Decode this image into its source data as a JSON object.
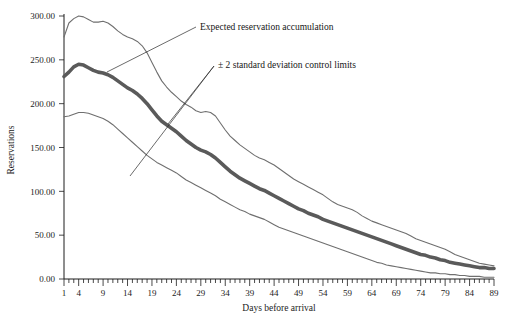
{
  "chart_data": {
    "type": "line",
    "title": "",
    "xlabel": "Days before arrival",
    "ylabel": "Reservations",
    "xlim": [
      1,
      89
    ],
    "ylim": [
      0,
      300
    ],
    "grid": false,
    "legend_position": "annotations-inline",
    "y_tick_labels": [
      "0.00",
      "50.00",
      "100.00",
      "150.00",
      "200.00",
      "250.00",
      "300.00"
    ],
    "y_tick_values": [
      0,
      50,
      100,
      150,
      200,
      250,
      300
    ],
    "x_tick_labels": [
      "1",
      "4",
      "9",
      "14",
      "19",
      "24",
      "29",
      "34",
      "39",
      "44",
      "49",
      "54",
      "59",
      "64",
      "69",
      "74",
      "79",
      "84",
      "89"
    ],
    "x_tick_values": [
      1,
      4,
      9,
      14,
      19,
      24,
      29,
      34,
      39,
      44,
      49,
      54,
      59,
      64,
      69,
      74,
      79,
      84,
      89
    ],
    "x_minor_tick_step": 1,
    "annotations": [
      {
        "id": "expected-annotation",
        "text": "Expected reservation accumulation",
        "points_to": "expected",
        "text_x": 200,
        "text_y": 30
      },
      {
        "id": "control-limits-annotation",
        "text": "± 2 standard deviation control limits",
        "points_to": "control-limits",
        "text_x": 218,
        "text_y": 68
      }
    ],
    "series": [
      {
        "name": "Upper control limit (+2 sd)",
        "style": "thin",
        "color": "#6f6f6f",
        "x": [
          1,
          2,
          3,
          4,
          5,
          6,
          7,
          8,
          9,
          10,
          11,
          12,
          13,
          14,
          15,
          16,
          17,
          18,
          19,
          20,
          21,
          22,
          23,
          24,
          25,
          26,
          27,
          28,
          29,
          30,
          31,
          32,
          33,
          34,
          35,
          36,
          37,
          38,
          39,
          40,
          41,
          42,
          43,
          44,
          45,
          46,
          47,
          48,
          49,
          50,
          51,
          52,
          53,
          54,
          55,
          56,
          57,
          58,
          59,
          60,
          61,
          62,
          63,
          64,
          65,
          66,
          67,
          68,
          69,
          70,
          71,
          72,
          73,
          74,
          75,
          76,
          77,
          78,
          79,
          80,
          81,
          82,
          83,
          84,
          85,
          86,
          87,
          88,
          89
        ],
        "y": [
          276,
          292,
          297,
          300,
          299,
          296,
          293,
          293,
          294,
          292,
          288,
          283,
          279,
          276,
          274,
          271,
          266,
          258,
          247,
          236,
          226,
          219,
          213,
          208,
          203,
          199,
          196,
          192,
          190,
          191,
          190,
          186,
          178,
          170,
          163,
          158,
          153,
          149,
          145,
          141,
          138,
          136,
          133,
          130,
          126,
          122,
          118,
          114,
          111,
          108,
          105,
          102,
          99,
          96,
          92,
          88,
          85,
          83,
          81,
          79,
          76,
          72,
          69,
          66,
          64,
          62,
          60,
          58,
          56,
          54,
          52,
          49,
          46,
          44,
          42,
          40,
          38,
          36,
          34,
          31,
          28,
          26,
          24,
          22,
          20,
          18,
          17,
          16,
          15
        ]
      },
      {
        "name": "Expected reservation accumulation",
        "style": "thick",
        "color": "#5a5a5a",
        "x": [
          1,
          2,
          3,
          4,
          5,
          6,
          7,
          8,
          9,
          10,
          11,
          12,
          13,
          14,
          15,
          16,
          17,
          18,
          19,
          20,
          21,
          22,
          23,
          24,
          25,
          26,
          27,
          28,
          29,
          30,
          31,
          32,
          33,
          34,
          35,
          36,
          37,
          38,
          39,
          40,
          41,
          42,
          43,
          44,
          45,
          46,
          47,
          48,
          49,
          50,
          51,
          52,
          53,
          54,
          55,
          56,
          57,
          58,
          59,
          60,
          61,
          62,
          63,
          64,
          65,
          66,
          67,
          68,
          69,
          70,
          71,
          72,
          73,
          74,
          75,
          76,
          77,
          78,
          79,
          80,
          81,
          82,
          83,
          84,
          85,
          86,
          87,
          88,
          89
        ],
        "y": [
          231,
          236,
          242,
          245,
          244,
          241,
          238,
          236,
          235,
          233,
          230,
          226,
          222,
          218,
          215,
          211,
          206,
          200,
          193,
          186,
          180,
          176,
          172,
          168,
          163,
          158,
          154,
          150,
          147,
          145,
          142,
          138,
          133,
          128,
          123,
          119,
          115,
          112,
          109,
          106,
          103,
          101,
          98,
          95,
          92,
          89,
          86,
          83,
          80,
          78,
          75,
          73,
          71,
          68,
          66,
          64,
          62,
          60,
          58,
          56,
          54,
          52,
          50,
          48,
          46,
          44,
          42,
          40,
          38,
          36,
          34,
          32,
          30,
          28,
          27,
          25,
          24,
          22,
          21,
          19,
          18,
          17,
          16,
          15,
          14,
          13,
          13,
          12,
          12
        ]
      },
      {
        "name": "Lower control limit (-2 sd)",
        "style": "thin",
        "color": "#6f6f6f",
        "x": [
          1,
          2,
          3,
          4,
          5,
          6,
          7,
          8,
          9,
          10,
          11,
          12,
          13,
          14,
          15,
          16,
          17,
          18,
          19,
          20,
          21,
          22,
          23,
          24,
          25,
          26,
          27,
          28,
          29,
          30,
          31,
          32,
          33,
          34,
          35,
          36,
          37,
          38,
          39,
          40,
          41,
          42,
          43,
          44,
          45,
          46,
          47,
          48,
          49,
          50,
          51,
          52,
          53,
          54,
          55,
          56,
          57,
          58,
          59,
          60,
          61,
          62,
          63,
          64,
          65,
          66,
          67,
          68,
          69,
          70,
          71,
          72,
          73,
          74,
          75,
          76,
          77,
          78,
          79,
          80,
          81,
          82,
          83,
          84,
          85,
          86,
          87,
          88,
          89
        ],
        "y": [
          185,
          186,
          188,
          190,
          190,
          189,
          187,
          185,
          183,
          180,
          176,
          171,
          166,
          161,
          156,
          151,
          146,
          141,
          137,
          133,
          130,
          127,
          124,
          121,
          117,
          113,
          110,
          107,
          104,
          101,
          98,
          95,
          91,
          88,
          85,
          82,
          79,
          77,
          74,
          72,
          70,
          68,
          65,
          62,
          59,
          57,
          55,
          53,
          51,
          49,
          47,
          45,
          43,
          41,
          39,
          37,
          35,
          33,
          31,
          29,
          27,
          25,
          23,
          21,
          19,
          18,
          16,
          15,
          14,
          13,
          12,
          11,
          10,
          9,
          8,
          7,
          7,
          6,
          6,
          5,
          5,
          4,
          4,
          3,
          3,
          3,
          2,
          2,
          2
        ]
      }
    ]
  }
}
